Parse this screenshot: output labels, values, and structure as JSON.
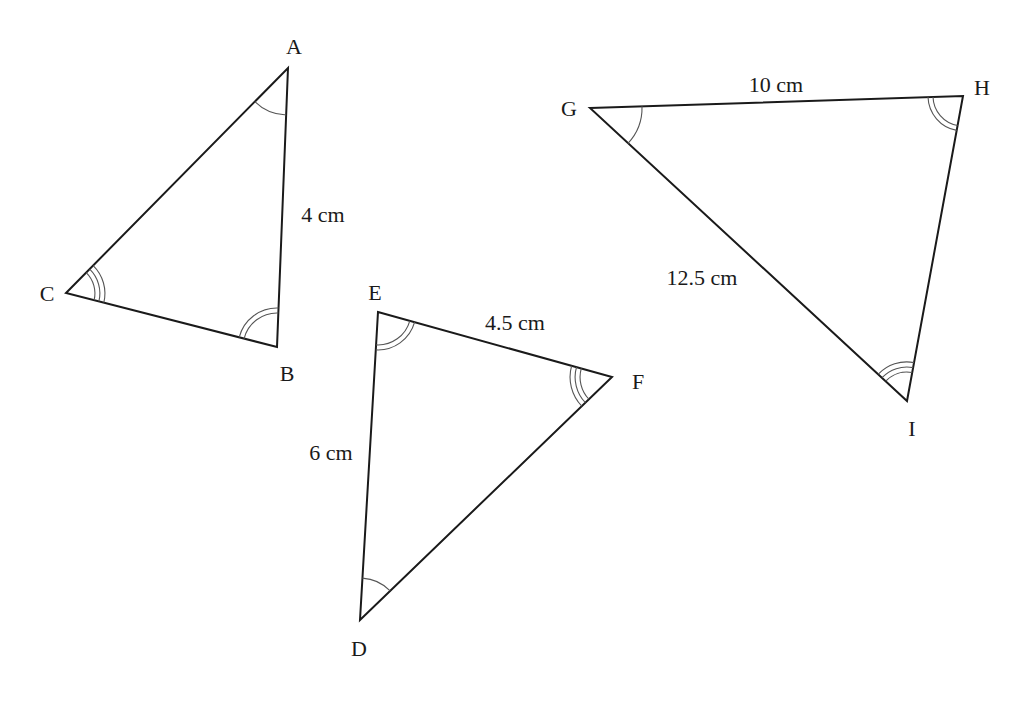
{
  "figure": {
    "background": "#ffffff",
    "line_color": "#1a1a1a",
    "triangles": [
      {
        "name": "ABC",
        "vertices": [
          {
            "label": "A",
            "x": 288,
            "y": 68,
            "label_x": 294,
            "label_y": 54,
            "arcs": 1
          },
          {
            "label": "B",
            "x": 277,
            "y": 347,
            "label_x": 287,
            "label_y": 381,
            "arcs": 2
          },
          {
            "label": "C",
            "x": 66,
            "y": 293,
            "label_x": 47,
            "label_y": 301,
            "arcs": 3
          }
        ],
        "side_labels": [
          {
            "text": "4 cm",
            "between": "AB",
            "x": 323,
            "y": 222
          }
        ]
      },
      {
        "name": "DEF",
        "vertices": [
          {
            "label": "E",
            "x": 378,
            "y": 312,
            "label_x": 375,
            "label_y": 300,
            "arcs": 2
          },
          {
            "label": "F",
            "x": 612,
            "y": 377,
            "label_x": 638,
            "label_y": 389,
            "arcs": 3
          },
          {
            "label": "D",
            "x": 360,
            "y": 620,
            "label_x": 359,
            "label_y": 656,
            "arcs": 1
          }
        ],
        "side_labels": [
          {
            "text": "4.5 cm",
            "between": "EF",
            "x": 515,
            "y": 330
          },
          {
            "text": "6 cm",
            "between": "DE",
            "x": 331,
            "y": 460
          }
        ]
      },
      {
        "name": "GHI",
        "vertices": [
          {
            "label": "G",
            "x": 590,
            "y": 108,
            "label_x": 569,
            "label_y": 116,
            "arcs": 1
          },
          {
            "label": "H",
            "x": 963,
            "y": 96,
            "label_x": 982,
            "label_y": 95,
            "arcs": 2
          },
          {
            "label": "I",
            "x": 907,
            "y": 401,
            "label_x": 912,
            "label_y": 436,
            "arcs": 3
          }
        ],
        "side_labels": [
          {
            "text": "10 cm",
            "between": "GH",
            "x": 776,
            "y": 92
          },
          {
            "text": "12.5 cm",
            "between": "GI",
            "x": 702,
            "y": 285
          }
        ]
      }
    ]
  }
}
